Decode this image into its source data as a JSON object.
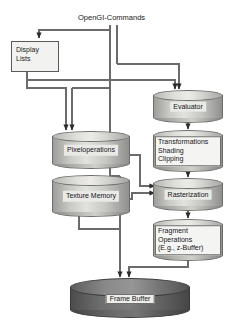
{
  "diagram": {
    "title": "OpenGI-Commands",
    "type": "flow-diagram",
    "background_color": "#ffffff",
    "nodes": [
      {
        "id": "commands",
        "label": "OpenGI-Commands",
        "shape": "caption"
      },
      {
        "id": "display-lists",
        "label_line1": "Display",
        "label_line2": "Lists",
        "shape": "rect"
      },
      {
        "id": "evaluator",
        "label": "Evaluator",
        "shape": "cylinder"
      },
      {
        "id": "transformations",
        "label_line1": "Transformations",
        "label_line2": "Shading",
        "label_line3": "Clipping",
        "shape": "cylinder"
      },
      {
        "id": "rasterization",
        "label": "Rasterization",
        "shape": "cylinder"
      },
      {
        "id": "fragment-ops",
        "label_line1": "Fragment",
        "label_line2": "Operations",
        "label_line3": "(E.g., z-Buffer)",
        "shape": "cylinder"
      },
      {
        "id": "pixeloperations",
        "label": "Pixeloperations",
        "shape": "cylinder"
      },
      {
        "id": "texture-memory",
        "label": "Texture Memory",
        "shape": "cylinder"
      },
      {
        "id": "frame-buffer",
        "label": "Frame Buffer",
        "shape": "disc"
      }
    ],
    "edges": [
      {
        "from": "commands",
        "to": "display-lists"
      },
      {
        "from": "commands",
        "to": "evaluator"
      },
      {
        "from": "commands",
        "to": "pixeloperations"
      },
      {
        "from": "display-lists",
        "to": "evaluator"
      },
      {
        "from": "display-lists",
        "to": "pixeloperations"
      },
      {
        "from": "evaluator",
        "to": "transformations"
      },
      {
        "from": "transformations",
        "to": "rasterization"
      },
      {
        "from": "pixeloperations",
        "to": "rasterization"
      },
      {
        "from": "texture-memory",
        "to": "rasterization"
      },
      {
        "from": "rasterization",
        "to": "fragment-ops"
      },
      {
        "from": "fragment-ops",
        "to": "frame-buffer"
      },
      {
        "from": "pixeloperations",
        "to": "frame-buffer"
      }
    ],
    "colors": {
      "line": "#6b6b6b",
      "cylinder_fill": "#c9c9c6",
      "cylinder_stroke": "#6d6d6b",
      "disc_fill": "#6e6e6e",
      "text": "#1a1a1a"
    }
  }
}
